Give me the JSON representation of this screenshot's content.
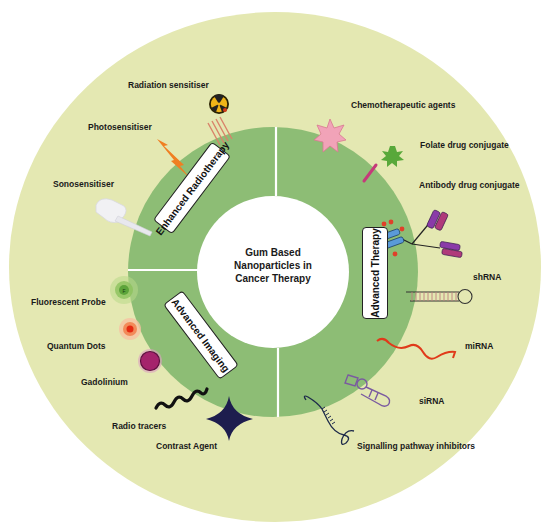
{
  "diagram": {
    "center_title": [
      "Gum Based",
      "Nanoparticles in",
      "Cancer Therapy"
    ],
    "sections": [
      {
        "name": "Enhanced Radiotherapy",
        "items": [
          "Radiation sensitiser",
          "Photosensitiser",
          "Sonosensitiser"
        ]
      },
      {
        "name": "Advanced Imaging",
        "items": [
          "Fluorescent Probe",
          "Quantum Dots",
          "Gadolinium",
          "Radio tracers",
          "Contrast Agent"
        ]
      },
      {
        "name": "Advanced Therapy",
        "items": [
          "Chemotherapeutic agents",
          "Folate drug conjugate",
          "Antibody drug conjugate",
          "shRNA",
          "miRNA",
          "siRNA",
          "Signalling pathway inhibitors"
        ]
      }
    ],
    "colors": {
      "outer_ring": "#e4e8b2",
      "inner_ring": "#8dbd75",
      "center": "#ffffff",
      "divider": "#ffffff"
    },
    "icons": {
      "radiation": "radiation-icon",
      "photosensitiser": "lightning-icon",
      "sonosensitiser": "ultrasound-probe-icon",
      "fluorescent_probe": "fluorescent-dot-icon",
      "quantum_dots": "quantum-dot-icon",
      "gadolinium": "gadolinium-sphere-icon",
      "radio_tracers": "wave-icon",
      "contrast_agent": "star-icon",
      "chemotherapeutic": "pink-star-icon",
      "folate": "green-star-stick-icon",
      "antibody": "antibody-icon",
      "shrna": "hairpin-rna-icon",
      "mirna": "mirna-strand-icon",
      "sirna": "sirna-icon",
      "signalling": "coil-strand-icon"
    }
  }
}
